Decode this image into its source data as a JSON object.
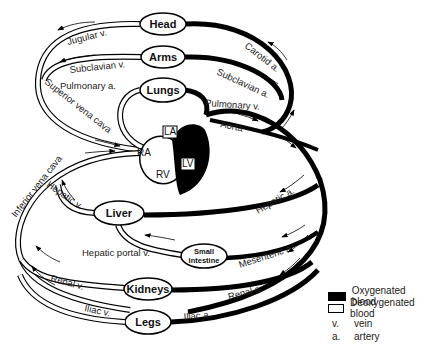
{
  "diagram": {
    "organs": {
      "head": "Head",
      "arms": "Arms",
      "lungs": "Lungs",
      "liver": "Liver",
      "small_intestine_1": "Small",
      "small_intestine_2": "Intestine",
      "kidneys": "Kidneys",
      "legs": "Legs"
    },
    "heart": {
      "la": "LA",
      "lv": "LV",
      "ra": "RA",
      "rv": "RV"
    },
    "vessels": {
      "jugular_v": "Jugular v.",
      "subclavian_v": "Subclavian v.",
      "pulmonary_a": "Pulmonary a.",
      "superior_vena_cava": "Superior vena cava",
      "inferior_vena_cava": "Inferior vena cava",
      "hepatic_v": "Hepatic v.",
      "hepatic_portal_v": "Hepatic portal v.",
      "renal_v": "Renal v.",
      "iliac_v": "Iliac v.",
      "carotid_a": "Carotid a.",
      "subclavian_a": "Subclavian a.",
      "pulmonary_v": "Pulmonary v.",
      "aorta": "Aorta",
      "hepatic_a": "Hepatic a.",
      "mesenteric_a": "Mesenteric a.",
      "renal_a": "Renal a.",
      "iliac_a": "Iliac a."
    },
    "colors": {
      "oxygenated": "#000000",
      "deoxygenated": "#ffffff",
      "outline": "#000000"
    }
  },
  "legend": {
    "oxygenated": "Oxygenated blood",
    "deoxygenated": "Deoxygenated blood",
    "abbreviations": [
      {
        "key": "v.",
        "value": "vein"
      },
      {
        "key": "a.",
        "value": "artery"
      }
    ]
  }
}
